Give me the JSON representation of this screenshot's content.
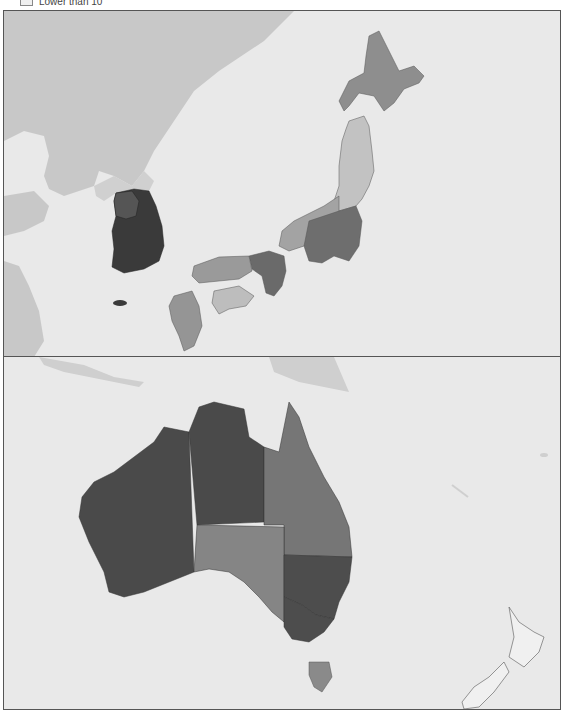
{
  "legend": {
    "items": [
      {
        "label": "Lower than 10",
        "color": "#f0f0f0"
      }
    ]
  },
  "panels": [
    {
      "name": "East Asia",
      "regions": [
        {
          "name": "South Korea",
          "shade": "#3a3a3a"
        },
        {
          "name": "Seoul/Gyeonggi",
          "shade": "#555555"
        },
        {
          "name": "Hokkaido",
          "shade": "#8e8e8e"
        },
        {
          "name": "Tohoku",
          "shade": "#c2c2c2"
        },
        {
          "name": "Kanto",
          "shade": "#6e6e6e"
        },
        {
          "name": "Chubu",
          "shade": "#a3a3a3"
        },
        {
          "name": "Kansai",
          "shade": "#6a6a6a"
        },
        {
          "name": "Chugoku",
          "shade": "#9a9a9a"
        },
        {
          "name": "Shikoku",
          "shade": "#bdbdbd"
        },
        {
          "name": "Kyushu",
          "shade": "#959595"
        }
      ]
    },
    {
      "name": "Oceania",
      "regions": [
        {
          "name": "Western Australia",
          "shade": "#4a4a4a"
        },
        {
          "name": "Northern Territory",
          "shade": "#4a4a4a"
        },
        {
          "name": "Queensland",
          "shade": "#767676"
        },
        {
          "name": "South Australia",
          "shade": "#858585"
        },
        {
          "name": "New South Wales",
          "shade": "#4d4d4d"
        },
        {
          "name": "Victoria",
          "shade": "#4d4d4d"
        },
        {
          "name": "Tasmania",
          "shade": "#8a8a8a"
        },
        {
          "name": "New Zealand",
          "shade": "#f0f0f0"
        }
      ]
    }
  ],
  "colors": {
    "sea": "#e9e9e9",
    "other_land": "#c8c8c8",
    "border": "#555555"
  }
}
